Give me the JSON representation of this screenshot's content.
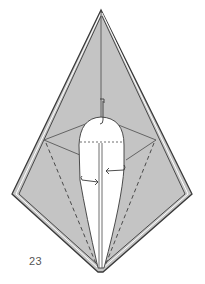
{
  "diagram": {
    "step_number": "23",
    "colors": {
      "paper_fill": "#c4c4c4",
      "inner_fill": "#ffffff",
      "edge_stroke": "#3a3a3a",
      "fold_line": "#4a4a4a",
      "label_text": "#555555"
    },
    "elements": [
      "outer-kite-shape",
      "layered-edges",
      "center-crease",
      "valley-fold-lines-dashed",
      "white-rounded-opening",
      "horizontal-dashed-line",
      "arrow-left-push",
      "arrow-right-push",
      "small-hook-arrow-top"
    ]
  }
}
